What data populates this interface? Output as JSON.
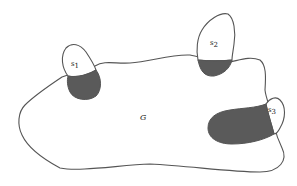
{
  "diagram": {
    "region": {
      "label": "G"
    },
    "subsets": [
      {
        "label": "s",
        "subscript": "1"
      },
      {
        "label": "s",
        "subscript": "2"
      },
      {
        "label": "s",
        "subscript": "3"
      }
    ],
    "colors": {
      "outline": "#555555",
      "shaded": "#5a5a5a",
      "background": "#ffffff"
    }
  }
}
